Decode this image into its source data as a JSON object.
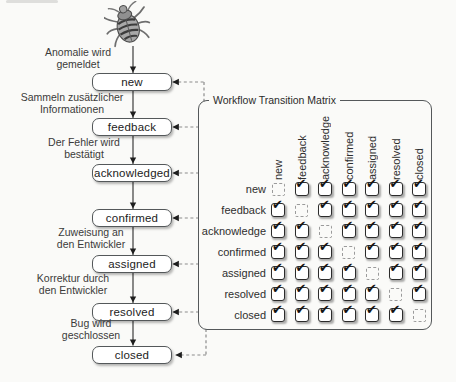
{
  "flow": {
    "steps": [
      {
        "state": "new",
        "annotation": [
          "Anomalie wird",
          "gemeldet"
        ]
      },
      {
        "state": "feedback",
        "annotation": [
          "Sammeln zusätzlicher",
          "Informationen"
        ]
      },
      {
        "state": "acknowledged",
        "annotation": [
          "Der Fehler wird",
          "bestätigt"
        ]
      },
      {
        "state": "confirmed",
        "annotation": []
      },
      {
        "state": "assigned",
        "annotation": [
          "Zuweisung an",
          "den Entwickler"
        ]
      },
      {
        "state": "resolved",
        "annotation": [
          "Korrektur durch",
          "den Entwickler"
        ]
      },
      {
        "state": "closed",
        "annotation": [
          "Bug wird",
          "geschlossen"
        ]
      }
    ]
  },
  "matrix": {
    "title": "Workflow Transition Matrix",
    "columns": [
      "new",
      "feedback",
      "acknowledge",
      "confirmed",
      "assigned",
      "resolved",
      "closed"
    ],
    "rows": [
      "new",
      "feedback",
      "acknowledge",
      "confirmed",
      "assigned",
      "resolved",
      "closed"
    ],
    "cells": [
      [
        false,
        true,
        true,
        true,
        true,
        true,
        true
      ],
      [
        true,
        false,
        true,
        true,
        true,
        true,
        true
      ],
      [
        true,
        true,
        false,
        true,
        true,
        true,
        true
      ],
      [
        true,
        true,
        true,
        false,
        true,
        true,
        true
      ],
      [
        true,
        true,
        true,
        true,
        false,
        true,
        true
      ],
      [
        true,
        true,
        true,
        true,
        true,
        false,
        true
      ],
      [
        true,
        true,
        true,
        true,
        true,
        true,
        false
      ]
    ]
  },
  "icons": {
    "bug": "bug-icon",
    "check_glyph": "✔"
  },
  "colors": {
    "paper": "#fafaf8",
    "box_border": "#54585a",
    "solid_line": "#3d3d3d",
    "dashed_line": "#8c8c8c",
    "checkbox_border": "#2b2b2b",
    "text": "#2e2e2e"
  }
}
